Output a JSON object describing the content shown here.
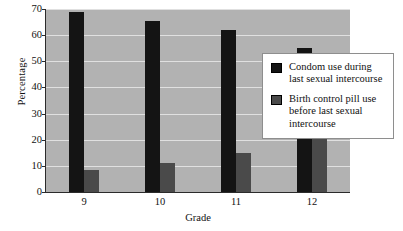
{
  "chart_data": {
    "type": "bar",
    "title": "",
    "xlabel": "Grade",
    "ylabel": "Percentage",
    "categories": [
      "9",
      "10",
      "11",
      "12"
    ],
    "ylim": [
      0,
      70
    ],
    "yticks": [
      0,
      10,
      20,
      30,
      40,
      50,
      60,
      70
    ],
    "grid": "horizontal",
    "legend_position": "inside-right",
    "series": [
      {
        "name": "Condom use during last sexual intercourse",
        "color": "#141414",
        "values": [
          69,
          65.5,
          62,
          55
        ]
      },
      {
        "name": "Birth control pill use before last sexual intercourse",
        "color": "#4a4a4a",
        "values": [
          8.5,
          11,
          15,
          22
        ]
      }
    ]
  },
  "legend": {
    "items": [
      {
        "label": "Condom use during last sexual intercourse",
        "swatch": "#141414"
      },
      {
        "label": "Birth control pill use before last sexual intercourse",
        "swatch": "#4a4a4a"
      }
    ]
  },
  "colors": {
    "plot_background": "#b2b2b2",
    "gridline": "#e8e8e8",
    "axis": "#2b2b2b",
    "page_background": "#ffffff",
    "text": "#111111"
  }
}
